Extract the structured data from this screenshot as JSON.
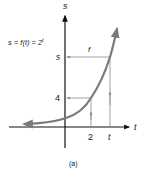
{
  "figure": {
    "caption": "(a)",
    "equation": "s = f(t) = 2",
    "equation_exponent": "t",
    "axes": {
      "x_label": "t",
      "y_label": "s"
    },
    "ticks": {
      "x": [
        {
          "label": "2",
          "value": 2
        },
        {
          "label": "t",
          "value": "t"
        }
      ],
      "y": [
        {
          "label": "4",
          "value": 4
        },
        {
          "label": "s",
          "value": "s"
        }
      ]
    },
    "mapping_label": "f",
    "colors": {
      "axis": "#111111",
      "curve": "#7a7a7a",
      "guides": "#8a8a8a",
      "text": "#222222"
    }
  }
}
